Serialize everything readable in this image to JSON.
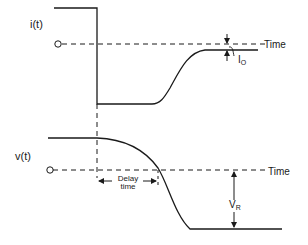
{
  "diagram": {
    "upper_waveform": {
      "label": "i(t)",
      "zero_marker": "O",
      "axis_label": "Time",
      "annotation": {
        "symbol": "I",
        "subscript": "O"
      }
    },
    "lower_waveform": {
      "label": "v(t)",
      "zero_marker": "O",
      "axis_label": "Time",
      "annotation": {
        "symbol": "V",
        "subscript": "R"
      }
    },
    "delay": {
      "line1": "Delay",
      "line2": "time"
    },
    "colors": {
      "stroke": "#1a1a1a",
      "background": "#ffffff"
    }
  }
}
